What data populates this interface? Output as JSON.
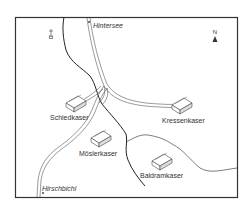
{
  "map": {
    "frame_color": "#333333",
    "road_color": "#555555",
    "river_color": "#222222",
    "stream_color": "#444444",
    "north_label": "N",
    "places": [
      {
        "id": "hintersee",
        "label": "Hintersee",
        "italic": true
      },
      {
        "id": "schiedkaser",
        "label": "Schiedkaser",
        "italic": false
      },
      {
        "id": "kressenkaser",
        "label": "Kressenkaser",
        "italic": false
      },
      {
        "id": "moslerkaser",
        "label": "Möslerkaser",
        "italic": false
      },
      {
        "id": "baldramkaser",
        "label": "Baldramkaser",
        "italic": false
      },
      {
        "id": "hirschbichl",
        "label": "Hirschbichl",
        "italic": true
      }
    ],
    "icons": {
      "chapel": "chapel-cross-icon",
      "north_arrow": "north-arrow-icon",
      "hut": "hut-icon"
    }
  }
}
